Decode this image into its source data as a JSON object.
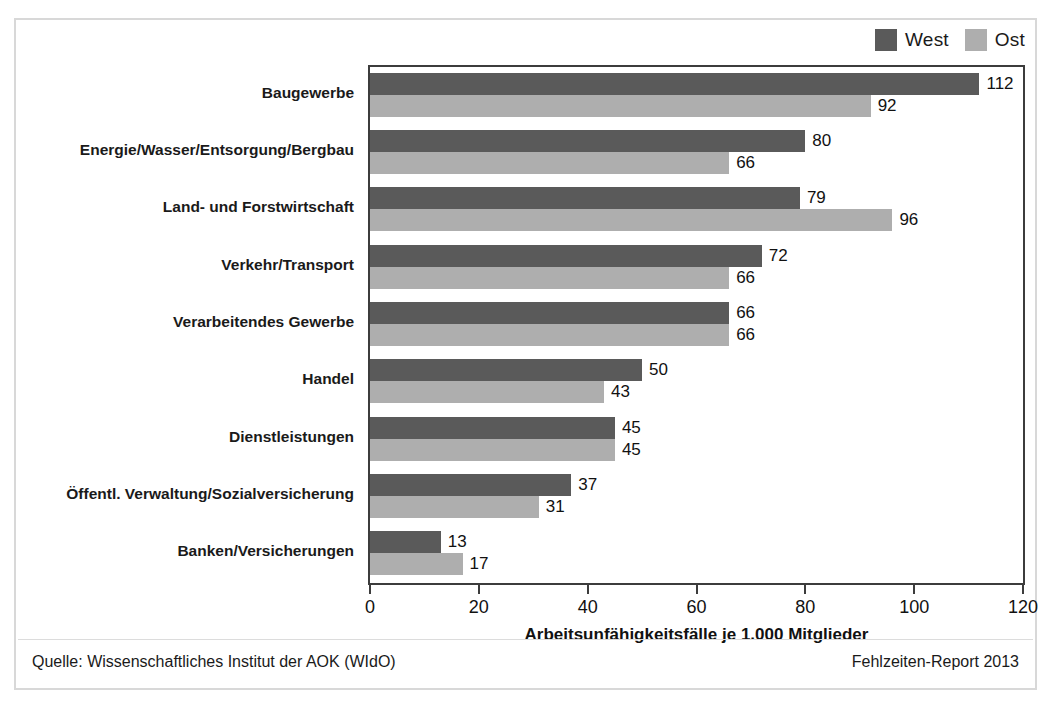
{
  "legend": {
    "items": [
      {
        "label": "West",
        "color": "#5a5a5a",
        "swatch_name": "legend-swatch-west"
      },
      {
        "label": "Ost",
        "color": "#aeaeae",
        "swatch_name": "legend-swatch-ost"
      }
    ]
  },
  "footer": {
    "source": "Quelle: Wissenschaftliches Institut der AOK (WIdO)",
    "report": "Fehlzeiten-Report 2013"
  },
  "chart_data": {
    "type": "bar",
    "orientation": "horizontal",
    "title": "",
    "xlabel": "Arbeitsunfähigkeitsfälle je 1.000 Mitglieder",
    "ylabel": "",
    "xlim": [
      0,
      120
    ],
    "xticks": [
      0,
      20,
      40,
      60,
      80,
      100,
      120
    ],
    "grid": false,
    "legend_position": "top-right",
    "categories": [
      "Baugewerbe",
      "Energie/Wasser/Entsorgung/Bergbau",
      "Land- und Forstwirtschaft",
      "Verkehr/Transport",
      "Verarbeitendes Gewerbe",
      "Handel",
      "Dienstleistungen",
      "Öffentl. Verwaltung/Sozialversicherung",
      "Banken/Versicherungen"
    ],
    "series": [
      {
        "name": "West",
        "color": "#5a5a5a",
        "values": [
          112,
          80,
          79,
          72,
          66,
          50,
          45,
          37,
          13
        ]
      },
      {
        "name": "Ost",
        "color": "#aeaeae",
        "values": [
          92,
          66,
          96,
          66,
          66,
          43,
          45,
          31,
          17
        ]
      }
    ]
  }
}
